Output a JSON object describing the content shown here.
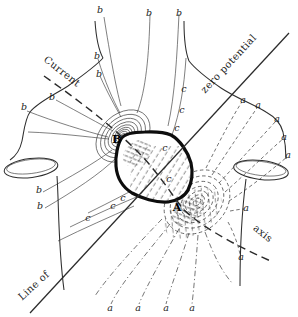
{
  "figure": {
    "colors": {
      "background": "#ffffff",
      "ink": "#2e2e2e",
      "heart_outline": "#0d0d0d"
    },
    "annotations": {
      "current": "Current",
      "zero_potential": "zero potential",
      "line_of": "Line of",
      "axis": "axis",
      "pole_negative": "B",
      "pole_positive": "A"
    },
    "field_labels": {
      "b": [
        [
          100,
          10
        ],
        [
          149,
          13
        ],
        [
          179,
          13
        ],
        [
          97,
          56
        ],
        [
          99,
          74
        ],
        [
          52,
          97
        ],
        [
          24,
          107
        ],
        [
          39,
          190
        ],
        [
          40,
          206
        ]
      ],
      "c": [
        [
          184,
          89
        ],
        [
          182,
          110
        ],
        [
          177,
          128
        ],
        [
          165,
          148
        ],
        [
          169,
          179
        ],
        [
          123,
          198
        ],
        [
          113,
          206
        ],
        [
          88,
          218
        ]
      ],
      "a": [
        [
          243,
          100
        ],
        [
          258,
          105
        ],
        [
          277,
          119
        ],
        [
          284,
          137
        ],
        [
          288,
          155
        ],
        [
          246,
          208
        ],
        [
          241,
          257
        ],
        [
          110,
          308
        ],
        [
          138,
          308
        ],
        [
          166,
          308
        ],
        [
          192,
          308
        ]
      ]
    }
  }
}
